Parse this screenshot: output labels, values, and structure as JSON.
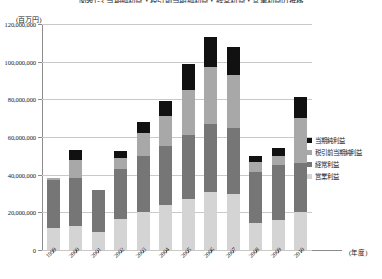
{
  "chart_data": {
    "type": "bar",
    "stacked": true,
    "title": "図表1-3 当期純利益・税引前当期純利益・経常利益・営業利益の推移",
    "unit_label": "(百万円)",
    "xlabel": "(年度)",
    "ylabel": "",
    "grid": true,
    "legend_position": "right",
    "ylim": [
      0,
      120000000
    ],
    "yticks": [
      0,
      20000000,
      40000000,
      60000000,
      80000000,
      100000000,
      120000000
    ],
    "ytick_labels": [
      "0",
      "20,000,000",
      "40,000,000",
      "60,000,000",
      "80,000,000",
      "100,000,000",
      "120,000,000"
    ],
    "categories": [
      "1999",
      "2000",
      "2001",
      "2002",
      "2003",
      "2004",
      "2005",
      "2006",
      "2007",
      "2008",
      "2009",
      "2010"
    ],
    "series": [
      {
        "name": "営業利益",
        "color": "#d4d4d4",
        "values": [
          11500000,
          13000000,
          9500000,
          16500000,
          20000000,
          24000000,
          27000000,
          31000000,
          30000000,
          14500000,
          16000000,
          20000000
        ]
      },
      {
        "name": "経常利益",
        "color": "#767676",
        "values": [
          25500000,
          25000000,
          22500000,
          26500000,
          30000000,
          31000000,
          34000000,
          36000000,
          35000000,
          27000000,
          29000000,
          26000000
        ]
      },
      {
        "name": "税引前当期純利益",
        "color": "#a8a8a8",
        "values": [
          1000000,
          10000000,
          0,
          6000000,
          12000000,
          16000000,
          24000000,
          30000000,
          28000000,
          5000000,
          5000000,
          24000000
        ]
      },
      {
        "name": "当期純利益",
        "color": "#111111",
        "values": [
          0,
          5000000,
          0,
          3500000,
          6000000,
          8000000,
          14000000,
          16000000,
          15000000,
          3500000,
          4000000,
          11000000
        ]
      }
    ],
    "totals": [
      38000000,
      53000000,
      32000000,
      52500000,
      68000000,
      79000000,
      99000000,
      113000000,
      108000000,
      50000000,
      54000000,
      81000000
    ]
  },
  "legend": {
    "items": [
      {
        "label": "当期純利益"
      },
      {
        "label": "税引前当期純利益"
      },
      {
        "label": "経常利益"
      },
      {
        "label": "営業利益"
      }
    ]
  }
}
